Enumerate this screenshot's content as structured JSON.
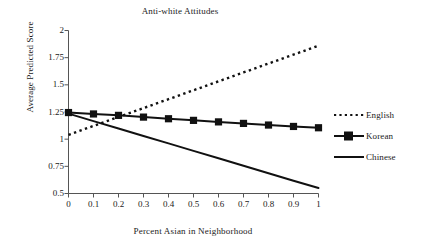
{
  "chart_data": {
    "type": "line",
    "title": "Anti-white Attitudes",
    "xlabel": "Percent Asian in Neighborhood",
    "ylabel": "Average Predicted Score",
    "xlim": [
      0,
      1
    ],
    "ylim": [
      0.5,
      2
    ],
    "grid": false,
    "legend_position": "right",
    "x": [
      0,
      0.1,
      0.2,
      0.3,
      0.4,
      0.5,
      0.6,
      0.7,
      0.8,
      0.9,
      1
    ],
    "xtick_labels": [
      "0",
      "0.1",
      "0.2",
      "0.3",
      "0.4",
      "0.5",
      "0.6",
      "0.7",
      "0.8",
      "0.9",
      "1"
    ],
    "ytick_values": [
      2,
      1.75,
      1.5,
      1.25,
      1,
      0.75,
      0.5
    ],
    "ytick_labels": [
      "2",
      "1.75",
      "1.5",
      "1.25",
      "1",
      "0.75",
      "0.5"
    ],
    "series": [
      {
        "name": "English",
        "style": "dotted",
        "marker": "none",
        "color": "#111111",
        "values": [
          1.04,
          1.122,
          1.204,
          1.286,
          1.368,
          1.45,
          1.532,
          1.614,
          1.696,
          1.778,
          1.86
        ]
      },
      {
        "name": "Korean",
        "style": "solid",
        "marker": "square",
        "color": "#111111",
        "values": [
          1.245,
          1.232,
          1.219,
          1.203,
          1.188,
          1.173,
          1.159,
          1.145,
          1.13,
          1.117,
          1.105
        ]
      },
      {
        "name": "Chinese",
        "style": "solid",
        "marker": "none",
        "color": "#111111",
        "values": [
          1.235,
          1.166,
          1.098,
          1.029,
          0.961,
          0.892,
          0.824,
          0.755,
          0.687,
          0.618,
          0.55
        ]
      }
    ]
  },
  "legend": {
    "items": [
      {
        "label": "English"
      },
      {
        "label": "Korean"
      },
      {
        "label": "Chinese"
      }
    ]
  }
}
